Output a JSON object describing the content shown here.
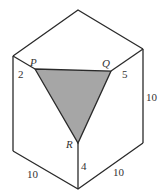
{
  "diagram": {
    "colors": {
      "edge": "#2a2a2a",
      "shade": "#a6a6a6",
      "background": "#ffffff",
      "text": "#333333"
    },
    "vertices": {
      "top": [
        78,
        10
      ],
      "left_upper": [
        13,
        56
      ],
      "right_upper": [
        143,
        49
      ],
      "front_upper": [
        78,
        96
      ],
      "left_lower": [
        13,
        151
      ],
      "right_lower": [
        143,
        143
      ],
      "bottom": [
        78,
        189
      ]
    },
    "triangle": {
      "P": {
        "label": "P",
        "pos": [
          35,
          69
        ]
      },
      "Q": {
        "label": "Q",
        "pos": [
          111,
          71
        ]
      },
      "R": {
        "label": "R",
        "pos": [
          78,
          143
        ]
      }
    },
    "labels": {
      "seg_left_top": "2",
      "seg_right_top": "5",
      "seg_bottom_R": "4",
      "right_edge": "10",
      "bottom_left_edge": "10",
      "bottom_right_edge": "10"
    }
  }
}
